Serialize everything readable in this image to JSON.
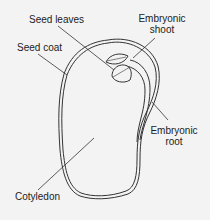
{
  "labels": {
    "seed_leaves": "Seed leaves",
    "embryonic_shoot_line1": "Embryonic",
    "embryonic_shoot_line2": "shoot",
    "seed_coat": "Seed coat",
    "embryonic_root_line1": "Embryonic",
    "embryonic_root_line2": "root",
    "cotyledon": "Cotyledon"
  },
  "colors": {
    "background": "#f3f3f3",
    "line": "#333333",
    "text": "#222222"
  }
}
